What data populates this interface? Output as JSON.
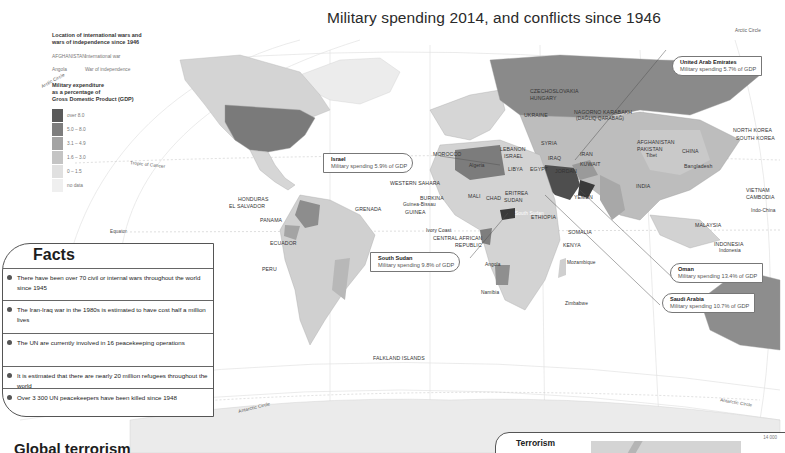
{
  "title": "Military spending 2014, and conflicts since 1946",
  "legend": {
    "wars_heading": "Location of international wars and wars of independence since 1946",
    "wars_heading_line1": "Location of international wars and",
    "wars_heading_line2": "wars of independence since 1946",
    "examples": [
      {
        "sample": "AFGHANISTAN",
        "meaning": "International war"
      },
      {
        "sample": "Angola",
        "meaning": "War of independence"
      }
    ],
    "spending_heading_line1": "Military expenditure",
    "spending_heading_line2": "as a percentage of",
    "spending_heading_line3": "Gross Domestic Product (GDP)",
    "classes": [
      {
        "label": "over 8.0",
        "color": "#5a5a5a"
      },
      {
        "label": "5.0 – 8.0",
        "color": "#7d7d7d"
      },
      {
        "label": "3.1 – 4.9",
        "color": "#a3a3a3"
      },
      {
        "label": "1.6 – 3.0",
        "color": "#c4c4c4"
      },
      {
        "label": "0 – 1.5",
        "color": "#e0e0e0"
      },
      {
        "label": "no data",
        "color": "#efefef"
      }
    ]
  },
  "reference_lines": {
    "arctic_circle_left": "Arctic Circle",
    "arctic_circle_right": "Arctic Circle",
    "tropic_of_cancer": "Tropic of Cancer",
    "equator": "Equator",
    "antarctic_circle_left": "Antarctic Circle",
    "antarctic_circle_right": "Antarctic Circle"
  },
  "callouts": [
    {
      "name": "United Arab Emirates",
      "text": "Military spending 5.7% of GDP"
    },
    {
      "name": "Israel",
      "text": "Military spending 5.9% of GDP"
    },
    {
      "name": "South Sudan",
      "text": "Military spending 9.8% of GDP"
    },
    {
      "name": "Oman",
      "text": "Military spending 13.4% of GDP"
    },
    {
      "name": "Saudi Arabia",
      "text": "Military spending 10.7% of GDP"
    }
  ],
  "country_labels": {
    "czechoslovakia": "CZECHOSLOVAKIA",
    "hungary": "HUNGARY",
    "ukraine": "UKRAINE",
    "nagorno": "NAGORNO KARABAKH",
    "nagorno_sub": "(DAĞLIQ QARABAĞ)",
    "morocco": "MOROCCO",
    "lebanon": "LEBANON",
    "israel": "ISRAEL",
    "syria": "SYRIA",
    "iraq": "IRAQ",
    "iran": "IRAN",
    "kuwait": "KUWAIT",
    "jordan": "JORDAN",
    "afghanistan": "AFGHANISTAN",
    "pakistan": "PAKISTAN",
    "tibet": "Tibet",
    "china": "CHINA",
    "north_korea": "NORTH KOREA",
    "south_korea": "SOUTH KOREA",
    "bangladesh": "Bangladesh",
    "india": "INDIA",
    "vietnam": "VIETNAM",
    "cambodia": "CAMBODIA",
    "indo_china": "Indo-China",
    "malaysia": "MALAYSIA",
    "indonesia_caps": "INDONESIA",
    "indonesia": "Indonesia",
    "algeria": "Algeria",
    "libya": "LIBYA",
    "egypt": "EGYPT",
    "western_sahara": "WESTERN SAHARA",
    "mali": "MALI",
    "burkina": "BURKINA",
    "guinea_bissau": "Guinea-Bissau",
    "guinea": "GUINEA",
    "chad": "CHAD",
    "sudan": "SUDAN",
    "eritrea": "ERITREA",
    "yemen": "YEMEN",
    "ethiopia": "ETHIOPIA",
    "south_sudan": "South Sudan",
    "somalia": "SOMALIA",
    "kenya": "KENYA",
    "ivory_coast": "Ivory Coast",
    "car": "CENTRAL AFRICAN",
    "car2": "REPUBLIC",
    "angola": "Angola",
    "mozambique": "Mozambique",
    "namibia": "Namibia",
    "zimbabwe": "Zimbabwe",
    "honduras": "HONDURAS",
    "el_salvador": "EL SALVADOR",
    "grenada": "GRENADA",
    "panama": "PANAMA",
    "ecuador": "ECUADOR",
    "peru": "PERU",
    "falklands": "FALKLAND ISLANDS"
  },
  "facts": {
    "title": "Facts",
    "items": [
      "There have been over 70 civil or internal wars throughout the world since 1945",
      "The Iran-Iraq war in the 1980s is estimated to have cost half a million lives",
      "The UN are currently involved in 16 peacekeeping operations",
      "It is estimated that there are nearly 20 million refugees throughout the world",
      "Over 3 300 UN peacekeepers have been killed since 1948"
    ]
  },
  "global_heading": "Global terrorism",
  "terrorism": {
    "title": "Terrorism",
    "axis_top": "14 000"
  }
}
